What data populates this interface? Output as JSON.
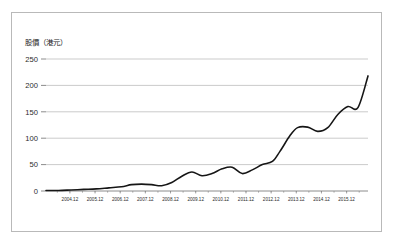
{
  "figure": {
    "background_color": "#ffffff",
    "border_color": "#b9b9b9"
  },
  "chart_data": {
    "type": "line",
    "title": "股價（港元）",
    "xlabel": "",
    "ylabel": "股價（港元）",
    "ylim": [
      0,
      250
    ],
    "yticks": [
      0,
      50,
      100,
      150,
      200,
      250
    ],
    "ytick_labels": [
      "0",
      "50",
      "100",
      "150",
      "200",
      "250"
    ],
    "grid": true,
    "legend": "none",
    "line_color": "#161616",
    "categories": [
      "2004.12",
      "2005.12",
      "2006.12",
      "2007.12",
      "2008.12",
      "2009.12",
      "2010.12",
      "2011.12",
      "2012.12",
      "2013.12",
      "2014.12",
      "2015.12"
    ],
    "xtick_labels": [
      "2004.12",
      "2005.12",
      "2006.12",
      "2007.12",
      "2008.12",
      "2009.12",
      "2010.12",
      "2011.12",
      "2012.12",
      "2013.12",
      "2014.12",
      "2015.12"
    ],
    "series": [
      {
        "name": "股價",
        "x": [
          2004.0,
          2004.5,
          2005.0,
          2005.5,
          2006.0,
          2006.5,
          2007.0,
          2007.4,
          2007.8,
          2008.2,
          2008.6,
          2009.0,
          2009.4,
          2009.8,
          2010.2,
          2010.6,
          2011.0,
          2011.4,
          2011.8,
          2012.2,
          2012.6,
          2013.0,
          2013.3,
          2013.7,
          2014.0,
          2014.4,
          2014.8,
          2015.2,
          2015.6,
          2016.0,
          2016.4,
          2016.8
        ],
        "values": [
          1,
          1,
          2,
          3,
          4,
          6,
          8,
          12,
          13,
          12,
          10,
          16,
          28,
          36,
          29,
          33,
          42,
          45,
          33,
          40,
          50,
          56,
          75,
          105,
          120,
          121,
          113,
          120,
          145,
          160,
          158,
          218
        ]
      }
    ],
    "annotations": []
  }
}
